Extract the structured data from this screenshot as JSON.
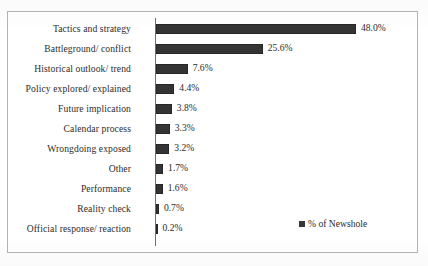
{
  "chart_data": {
    "type": "bar",
    "orientation": "horizontal",
    "title": "",
    "xlabel": "",
    "ylabel": "",
    "grid": false,
    "legend_position": "bottom-right-inside",
    "legend": [
      "% of Newshole"
    ],
    "value_suffix": "%",
    "xlim": [
      0,
      48
    ],
    "series_color": "#252525",
    "categories": [
      "Tactics and strategy",
      "Battleground/ conflict",
      "Historical outlook/ trend",
      "Policy explored/ explained",
      "Future implication",
      "Calendar process",
      "Wrongdoing exposed",
      "Other",
      "Performance",
      "Reality check",
      "Official response/ reaction"
    ],
    "values": [
      48.0,
      25.6,
      7.6,
      4.4,
      3.8,
      3.3,
      3.2,
      1.7,
      1.6,
      0.7,
      0.2
    ],
    "labels": [
      "48.0%",
      "25.6%",
      "7.6%",
      "4.4%",
      "3.8%",
      "3.3%",
      "3.2%",
      "1.7%",
      "1.6%",
      "0.7%",
      "0.2%"
    ],
    "series": [
      {
        "name": "% of Newshole",
        "values": [
          48.0,
          25.6,
          7.6,
          4.4,
          3.8,
          3.3,
          3.2,
          1.7,
          1.6,
          0.7,
          0.2
        ]
      }
    ]
  },
  "legend": {
    "entry_label": "% of Newshole"
  },
  "caption": {
    "text": ""
  }
}
